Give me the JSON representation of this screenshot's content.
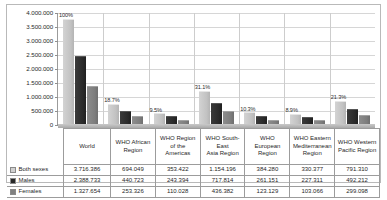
{
  "chart_data": {
    "type": "bar",
    "title": "",
    "subtitle": "",
    "xlabel": "",
    "ylabel": "",
    "ylim": [
      0,
      4000000
    ],
    "y_ticks": [
      "0",
      "500.000",
      "1.000.000",
      "1.500.000",
      "2.000.000",
      "2.500.000",
      "3.000.000",
      "3.500.000",
      "4.000.000"
    ],
    "y_tick_values": [
      0,
      500000,
      1000000,
      1500000,
      2000000,
      2500000,
      3000000,
      3500000,
      4000000
    ],
    "grid": true,
    "legend_position": "table-row-labels",
    "categories": [
      "World",
      "WHO African Region",
      "WHO Region of the Americas",
      "WHO South-East Asia Region",
      "WHO European Region",
      "WHO Eastern Mediterranean Region",
      "WHO Western Pacific Region"
    ],
    "category_lines": [
      [
        "World"
      ],
      [
        "WHO African",
        "Region"
      ],
      [
        "WHO Region",
        "of the",
        "Americas"
      ],
      [
        "WHO South-",
        "East",
        "Asia Region"
      ],
      [
        "WHO European",
        "Region"
      ],
      [
        "WHO Eastern",
        "Mediterranean",
        "Region"
      ],
      [
        "WHO Western",
        "Pacific Region"
      ]
    ],
    "series": [
      {
        "name": "Both sexes",
        "color": "#c8c8c8",
        "values": [
          3716386,
          694049,
          353422,
          1154196,
          384280,
          330377,
          791310
        ],
        "labels": [
          "3.716.386",
          "694.049",
          "353.422",
          "1.154.196",
          "384.280",
          "330.377",
          "791.310"
        ]
      },
      {
        "name": "Males",
        "color": "#272727",
        "values": [
          2388733,
          440723,
          243394,
          717814,
          261151,
          227311,
          492212
        ],
        "labels": [
          "2.388.733",
          "440.723",
          "243.394",
          "717.814",
          "261.151",
          "227.311",
          "492.212"
        ]
      },
      {
        "name": "Females",
        "color": "#808080",
        "values": [
          1327654,
          253326,
          110028,
          436382,
          123129,
          103066,
          299098
        ],
        "labels": [
          "1.327.654",
          "253.326",
          "110.028",
          "436.382",
          "123.129",
          "103.066",
          "299.098"
        ]
      }
    ],
    "annotations": [
      {
        "category": "World",
        "text": "100%"
      },
      {
        "category": "WHO African Region",
        "text": "18.7%"
      },
      {
        "category": "WHO Region of the Americas",
        "text": "9.5%"
      },
      {
        "category": "WHO South-East Asia Region",
        "text": "31.1%"
      },
      {
        "category": "WHO European Region",
        "text": "10.3%"
      },
      {
        "category": "WHO Eastern Mediterranean Region",
        "text": "8.9%"
      },
      {
        "category": "WHO Western Pacific Region",
        "text": "21.3%"
      }
    ]
  }
}
